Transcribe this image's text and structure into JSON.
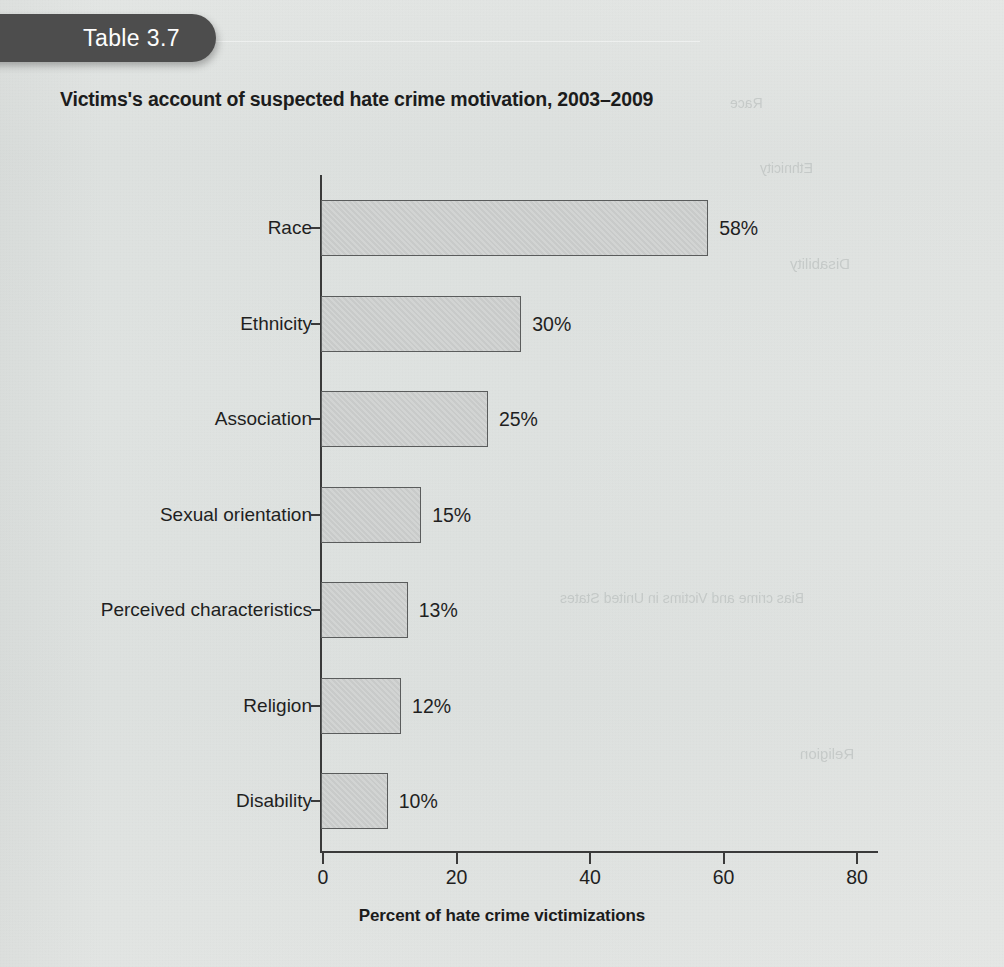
{
  "badge": {
    "label": "Table 3.7"
  },
  "chart_data": {
    "type": "bar",
    "orientation": "horizontal",
    "title": "Victims's account of suspected hate crime motivation, 2003–2009",
    "xlabel": "Percent of hate crime victimizations",
    "ylabel": "",
    "categories": [
      "Race",
      "Ethnicity",
      "Association",
      "Sexual orientation",
      "Perceived characteristics",
      "Religion",
      "Disability"
    ],
    "values": [
      58,
      30,
      25,
      15,
      13,
      12,
      10
    ],
    "value_labels": [
      "58%",
      "30%",
      "25%",
      "15%",
      "13%",
      "12%",
      "10%"
    ],
    "xlim": [
      0,
      85
    ],
    "xticks": [
      0,
      20,
      40,
      60,
      80
    ],
    "xtick_labels": [
      "0",
      "20",
      "40",
      "60",
      "80"
    ],
    "grid": false,
    "legend": false,
    "bar_fill_color": "#d2d4d3",
    "bar_edge_color": "#5a5c5c",
    "axis_color": "#3a3a3a",
    "text_color": "#1f1f1f",
    "background_color": "#eef0ef"
  },
  "ghost_text": [
    "Disability",
    "Religion",
    "Race",
    "Ethnicity",
    "Bias crime and Victims in United States"
  ]
}
